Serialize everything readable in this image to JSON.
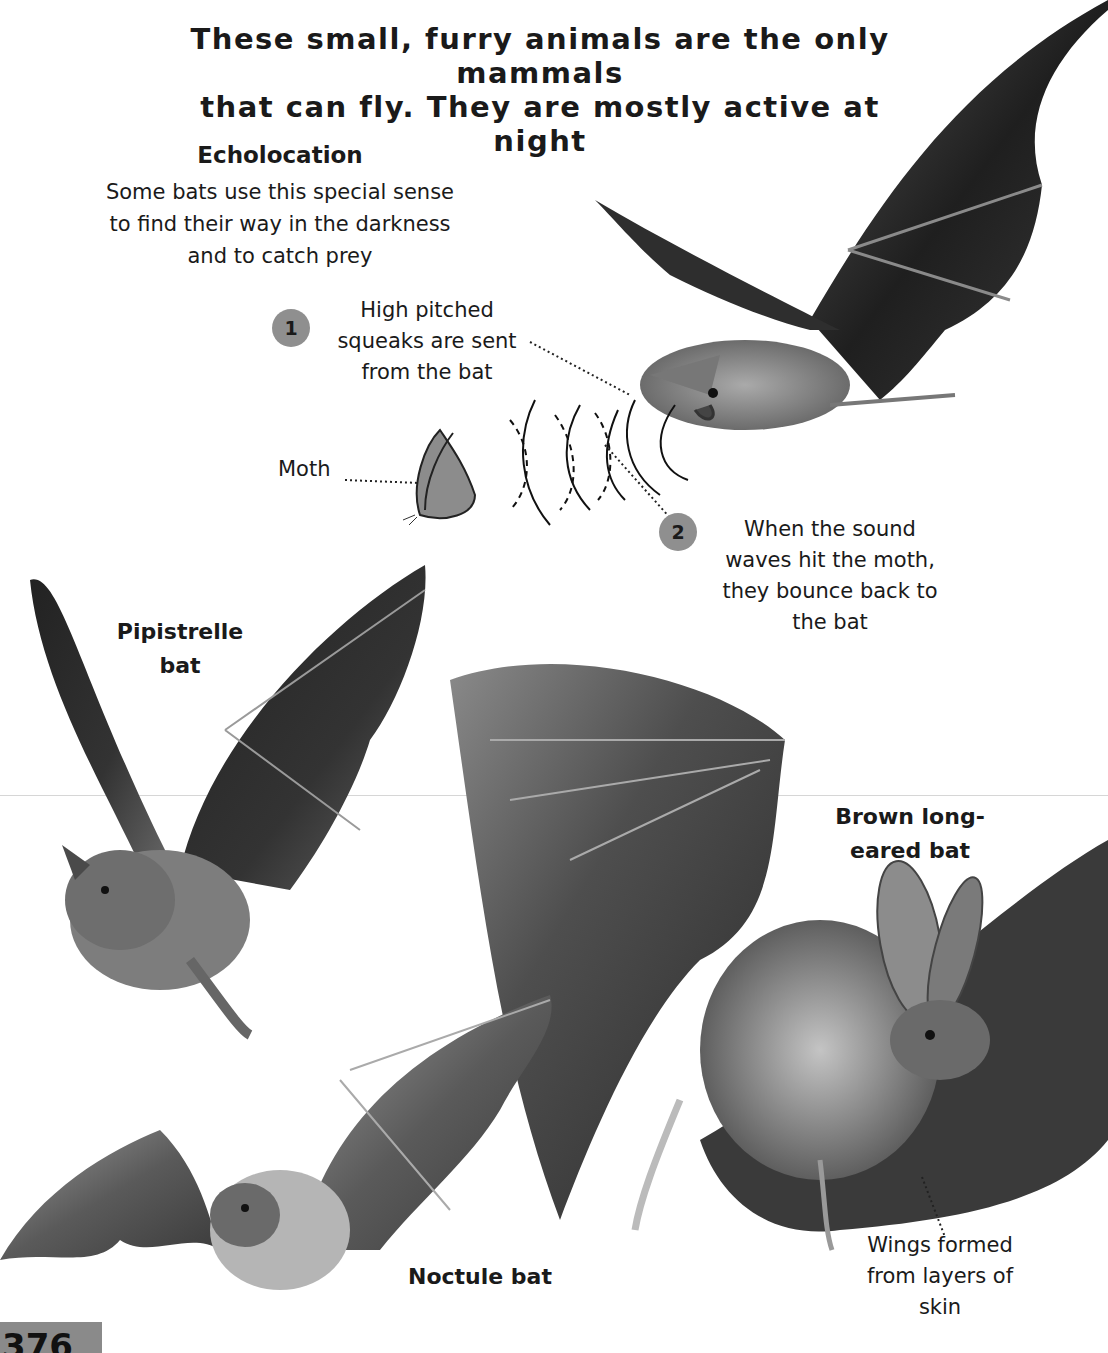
{
  "intro": {
    "line1": "These small, furry animals are the only mammals",
    "line2": "that can fly. They are mostly active at night"
  },
  "echolocation": {
    "title": "Echolocation",
    "body": [
      "Some bats use this special sense",
      "to find their way in the darkness",
      "and to catch prey"
    ]
  },
  "steps": [
    {
      "number": "1",
      "text": [
        "High pitched",
        "squeaks are sent",
        "from the bat"
      ]
    },
    {
      "number": "2",
      "text": [
        "When the sound",
        "waves hit the moth,",
        "they bounce back to",
        "the bat"
      ]
    }
  ],
  "moth": {
    "label": "Moth"
  },
  "bats": [
    {
      "name": [
        "Pipistrelle",
        "bat"
      ]
    },
    {
      "name": [
        "Brown long-",
        "eared bat"
      ]
    },
    {
      "name": [
        "Noctule bat"
      ]
    }
  ],
  "wings_note": [
    "Wings formed",
    "from layers of",
    "skin"
  ],
  "page_number": "376",
  "colors": {
    "badge": "#8f8f8f",
    "ink": "#1a1a1a",
    "wing_dark": "#2b2b2b",
    "wing_mid": "#6e6e6e",
    "fur": "#9a9a9a"
  }
}
